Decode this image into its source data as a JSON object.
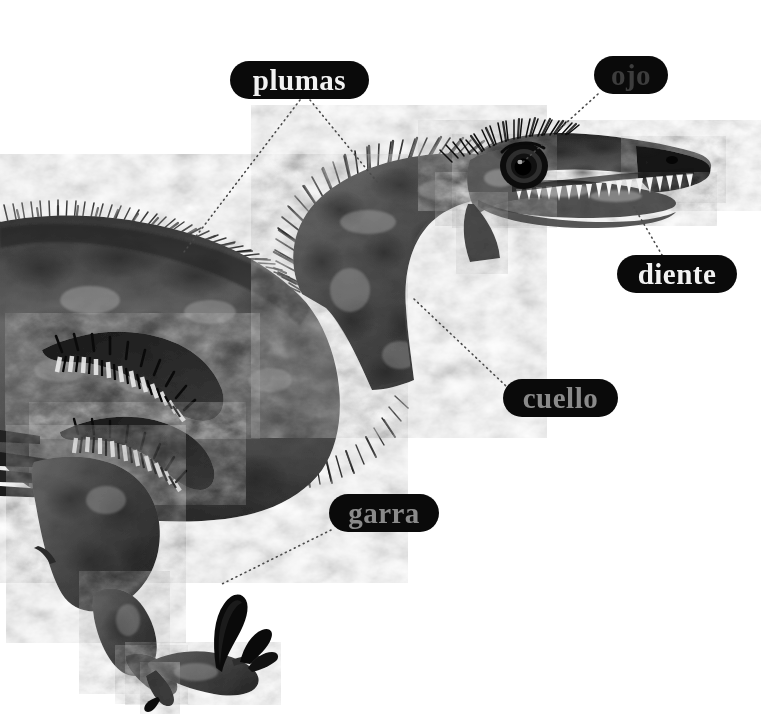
{
  "canvas": {
    "width": 778,
    "height": 719,
    "background": "#ffffff"
  },
  "illustration": {
    "subject": "feathered raptor dinosaur",
    "style": "grayscale anatomical illustration",
    "description": "Side view of a feathered theropod dinosaur facing right, showing head, S-curved neck, mottled body, wing feathers, hind leg and sickle-clawed foot",
    "palette": {
      "skin_dark": "#2b2b2b",
      "skin_mid": "#5a5a5a",
      "skin_light": "#9a9a9a",
      "skin_highlight": "#cfcfcf",
      "feather": "#141414",
      "tooth": "#f2f2f2",
      "eye_ring": "#111111",
      "background": "#ffffff"
    }
  },
  "labels": [
    {
      "id": "plumas",
      "text": "plumas",
      "pill": {
        "x": 230,
        "y": 61,
        "width": 139,
        "height": 38,
        "radius": 19
      },
      "fill": "#0a0a0a",
      "text_color": "#f2f2f2",
      "font_size": 29,
      "leaders": [
        {
          "from": [
            300,
            100
          ],
          "to": [
            184,
            252
          ]
        },
        {
          "from": [
            310,
            100
          ],
          "to": [
            378,
            183
          ]
        }
      ]
    },
    {
      "id": "ojo",
      "text": "ojo",
      "pill": {
        "x": 594,
        "y": 56,
        "width": 74,
        "height": 38,
        "radius": 19
      },
      "fill": "#0a0a0a",
      "text_color": "#3d3d3d",
      "font_size": 29,
      "leaders": [
        {
          "from": [
            598,
            94
          ],
          "to": [
            522,
            163
          ]
        }
      ]
    },
    {
      "id": "diente",
      "text": "diente",
      "pill": {
        "x": 617,
        "y": 255,
        "width": 120,
        "height": 38,
        "radius": 19
      },
      "fill": "#0a0a0a",
      "text_color": "#f2f2f2",
      "font_size": 29,
      "leaders": [
        {
          "from": [
            634,
            207
          ],
          "to": [
            662,
            255
          ]
        }
      ]
    },
    {
      "id": "cuello",
      "text": "cuello",
      "pill": {
        "x": 503,
        "y": 379,
        "width": 115,
        "height": 38,
        "radius": 19
      },
      "fill": "#0a0a0a",
      "text_color": "#8a8a8a",
      "font_size": 29,
      "leaders": [
        {
          "from": [
            414,
            299
          ],
          "to": [
            506,
            386
          ]
        }
      ]
    },
    {
      "id": "garra",
      "text": "garra",
      "pill": {
        "x": 329,
        "y": 494,
        "width": 110,
        "height": 38,
        "radius": 19
      },
      "fill": "#0a0a0a",
      "text_color": "#8a8a8a",
      "font_size": 29,
      "leaders": [
        {
          "from": [
            331,
            530
          ],
          "to": [
            222,
            584
          ]
        }
      ]
    }
  ],
  "leader_style": {
    "color": "#4a4a4a",
    "dash": "1 4",
    "width": 1.6,
    "linecap": "round"
  }
}
